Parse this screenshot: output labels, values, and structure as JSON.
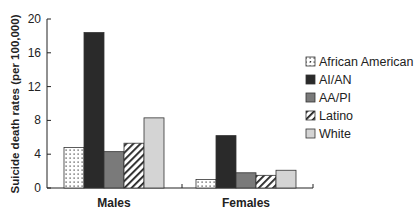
{
  "chart_data": {
    "type": "bar",
    "title": "",
    "xlabel": "",
    "ylabel": "Suicide death rates (per 100,000)",
    "ylim": [
      0,
      20
    ],
    "yticks": [
      0,
      4,
      8,
      12,
      16,
      20
    ],
    "categories": [
      "Males",
      "Females"
    ],
    "series": [
      {
        "name": "African American",
        "values": [
          4.8,
          1.0
        ],
        "fill": "dots",
        "color": "#ffffff"
      },
      {
        "name": "AI/AN",
        "values": [
          18.4,
          6.2
        ],
        "fill": "solid",
        "color": "#2a2a2a"
      },
      {
        "name": "AA/PI",
        "values": [
          4.3,
          1.8
        ],
        "fill": "solid",
        "color": "#7a7a7a"
      },
      {
        "name": "Latino",
        "values": [
          5.3,
          1.5
        ],
        "fill": "hatch",
        "color": "#ffffff"
      },
      {
        "name": "White",
        "values": [
          8.3,
          2.1
        ],
        "fill": "solid",
        "color": "#d4d4d4"
      }
    ],
    "grid": false,
    "legend_position": "right"
  }
}
